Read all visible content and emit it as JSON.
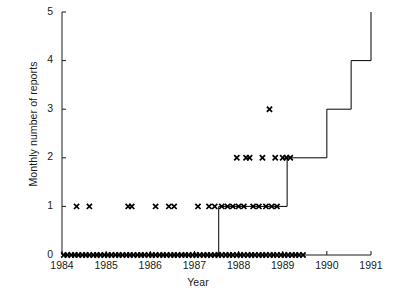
{
  "chart_data": {
    "type": "line",
    "title": "",
    "subtitle": "",
    "xlabel": "Year",
    "ylabel": "Monthly number of reports",
    "xlim": [
      1984,
      1991
    ],
    "ylim": [
      0,
      5
    ],
    "xticks": [
      1984,
      1985,
      1986,
      1987,
      1988,
      1989,
      1990,
      1991
    ],
    "xtick_labels": [
      "1984",
      "1985",
      "1986",
      "1987",
      "1988",
      "1989",
      "1990",
      "1991"
    ],
    "yticks": [
      0,
      1,
      2,
      3,
      4,
      5
    ],
    "ytick_labels": [
      "0",
      "1",
      "2",
      "3",
      "4",
      "5"
    ],
    "grid": false,
    "legend": null,
    "series": [
      {
        "name": "cumulative step",
        "style": "step-post",
        "color": "#000000",
        "points": [
          [
            1984.0,
            0
          ],
          [
            1987.55,
            0
          ],
          [
            1987.55,
            1
          ],
          [
            1989.1,
            1
          ],
          [
            1989.1,
            2
          ],
          [
            1990.0,
            2
          ],
          [
            1990.0,
            3
          ],
          [
            1990.55,
            3
          ],
          [
            1990.55,
            4
          ],
          [
            1991.0,
            4
          ],
          [
            1991.0,
            5
          ]
        ]
      },
      {
        "name": "monthly reports",
        "style": "markers",
        "marker": "x",
        "color": "#000000",
        "x": [
          1984.04,
          1984.12,
          1984.21,
          1984.29,
          1984.37,
          1984.46,
          1984.54,
          1984.62,
          1984.71,
          1984.79,
          1984.87,
          1984.96,
          1985.04,
          1985.12,
          1985.21,
          1985.29,
          1985.37,
          1985.46,
          1985.54,
          1985.62,
          1985.71,
          1985.79,
          1985.87,
          1985.96,
          1986.04,
          1986.12,
          1986.21,
          1986.29,
          1986.37,
          1986.46,
          1986.54,
          1986.62,
          1986.71,
          1986.79,
          1986.87,
          1986.96,
          1987.04,
          1987.12,
          1987.21,
          1987.29,
          1987.37,
          1987.46,
          1987.54,
          1987.62,
          1987.71,
          1987.79,
          1987.87,
          1987.96,
          1988.04,
          1988.12,
          1988.21,
          1988.29,
          1988.37,
          1988.46,
          1988.54,
          1988.62,
          1988.71,
          1988.79,
          1988.87,
          1988.96,
          1989.04,
          1989.12,
          1989.21,
          1989.29,
          1989.37,
          1989.46,
          1984.33,
          1984.62,
          1985.5,
          1985.58,
          1986.12,
          1986.42,
          1986.54,
          1987.08,
          1987.33,
          1987.46,
          1987.62,
          1987.75,
          1987.87,
          1988.0,
          1988.12,
          1988.33,
          1988.46,
          1988.62,
          1988.75,
          1988.87,
          1987.96,
          1988.17,
          1988.25,
          1988.54,
          1988.83,
          1989.0,
          1989.08,
          1989.17,
          1988.7
        ],
        "y": [
          0,
          0,
          0,
          0,
          0,
          0,
          0,
          0,
          0,
          0,
          0,
          0,
          0,
          0,
          0,
          0,
          0,
          0,
          0,
          0,
          0,
          0,
          0,
          0,
          0,
          0,
          0,
          0,
          0,
          0,
          0,
          0,
          0,
          0,
          0,
          0,
          0,
          0,
          0,
          0,
          0,
          0,
          0,
          0,
          0,
          0,
          0,
          0,
          0,
          0,
          0,
          0,
          0,
          0,
          0,
          0,
          0,
          0,
          0,
          0,
          0,
          0,
          0,
          0,
          0,
          0,
          1,
          1,
          1,
          1,
          1,
          1,
          1,
          1,
          1,
          1,
          1,
          1,
          1,
          1,
          1,
          1,
          1,
          1,
          1,
          1,
          2,
          2,
          2,
          2,
          2,
          2,
          2,
          2,
          3
        ]
      }
    ]
  },
  "axes": {
    "x_axis_name": "year-axis",
    "y_axis_name": "reports-axis"
  }
}
